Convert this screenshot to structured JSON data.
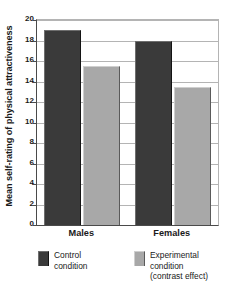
{
  "chart_data": {
    "type": "bar",
    "title": "",
    "xlabel": "",
    "ylabel": "Mean self-rating of physical attractiveness",
    "categories": [
      "Males",
      "Females"
    ],
    "ylim": [
      0,
      20
    ],
    "yticks": [
      0,
      2,
      4,
      6,
      8,
      10,
      12,
      14,
      16,
      18,
      20
    ],
    "ytick_labels": [
      "0",
      "2",
      "4",
      "6",
      "8",
      "10",
      "12",
      "14",
      "16",
      "18",
      "20"
    ],
    "grid": true,
    "legend_position": "below",
    "series": [
      {
        "name": "Control condition",
        "color": "#3a3a3a",
        "values": [
          19.0,
          18.0
        ]
      },
      {
        "name": "Experimental condition (contrast effect)",
        "color": "#a8a8a8",
        "values": [
          15.5,
          13.5
        ]
      }
    ]
  },
  "legend": {
    "entries": [
      {
        "line1": "Control",
        "line2": "condition",
        "line3": "",
        "swatch": "dark-swatch-icon"
      },
      {
        "line1": "Experimental",
        "line2": "condition",
        "line3": "(contrast effect)",
        "swatch": "light-swatch-icon"
      }
    ]
  }
}
